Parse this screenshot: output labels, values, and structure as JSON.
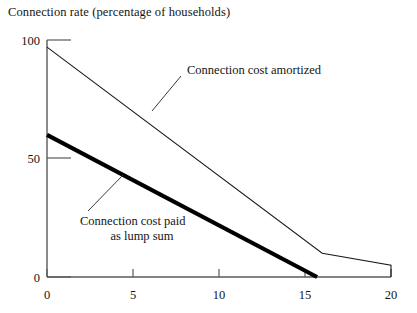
{
  "chart_data": {
    "type": "line",
    "title": "Connection rate (percentage of households)",
    "xlabel": "",
    "ylabel": "",
    "xlim": [
      0,
      20
    ],
    "ylim": [
      0,
      100
    ],
    "grid": false,
    "legend_position": "inline-annotations",
    "xticks": [
      "0",
      "5",
      "10",
      "15",
      "20"
    ],
    "xtick_values": [
      0,
      5,
      10,
      15,
      20
    ],
    "yticks": [
      "0",
      "50",
      "100"
    ],
    "ytick_values": [
      0,
      50,
      100
    ],
    "series": [
      {
        "name": "Connection cost amortized",
        "style": "thin",
        "x": [
          0,
          16,
          20,
          20
        ],
        "values": [
          97,
          10,
          5,
          0
        ]
      },
      {
        "name": "Connection cost paid as lump sum",
        "style": "thick",
        "x": [
          0,
          15.7
        ],
        "values": [
          60,
          0
        ]
      }
    ],
    "annotations": [
      {
        "id": "amortized",
        "lines": [
          "Connection cost amortized"
        ],
        "text": "Connection cost amortized"
      },
      {
        "id": "lump-sum",
        "lines": [
          "Connection cost paid",
          "as lump sum"
        ],
        "text": "Connection cost paid as lump sum"
      }
    ],
    "colors": {
      "line": "#000000",
      "axis": "#4a4a4a",
      "text": "#141414",
      "background": "#ffffff"
    }
  }
}
